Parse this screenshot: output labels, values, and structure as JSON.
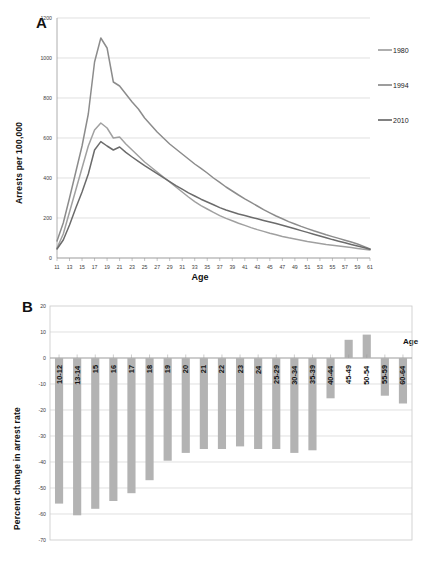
{
  "figure": {
    "panel_a_letter": "A",
    "panel_b_letter": "B"
  },
  "panel_a": {
    "ylabel": "Arrests per 100,000",
    "xlabel": "Age",
    "legend": [
      {
        "label": "1980",
        "color": "#a0a0a0"
      },
      {
        "label": "1994",
        "color": "#8c8c8c"
      },
      {
        "label": "2010",
        "color": "#6b6b6b"
      }
    ]
  },
  "panel_b": {
    "ylabel": "Percent change in arrest rate",
    "xlabel": "Age",
    "bar_color": "#b3b3b3"
  },
  "chart_data": [
    {
      "type": "line",
      "title": "A",
      "xlabel": "Age",
      "ylabel": "Arrests per 100,000",
      "xlim": [
        11,
        61
      ],
      "ylim": [
        0,
        1200
      ],
      "yticks": [
        0,
        200,
        400,
        600,
        800,
        1000,
        1200
      ],
      "xticks": [
        11,
        13,
        15,
        17,
        19,
        21,
        23,
        25,
        27,
        29,
        31,
        33,
        35,
        37,
        39,
        41,
        43,
        45,
        47,
        49,
        51,
        53,
        55,
        57,
        59,
        61
      ],
      "grid": true,
      "legend_position": "right",
      "x": [
        11,
        12,
        13,
        14,
        15,
        16,
        17,
        18,
        19,
        20,
        21,
        22,
        23,
        24,
        25,
        26,
        27,
        28,
        29,
        30,
        31,
        32,
        33,
        34,
        35,
        36,
        37,
        38,
        39,
        40,
        41,
        42,
        43,
        44,
        45,
        46,
        47,
        48,
        49,
        50,
        51,
        52,
        53,
        54,
        55,
        56,
        57,
        58,
        59,
        60,
        61
      ],
      "series": [
        {
          "name": "1980",
          "color": "#a0a0a0",
          "values": [
            50,
            120,
            230,
            340,
            450,
            560,
            640,
            675,
            650,
            600,
            605,
            570,
            540,
            510,
            480,
            455,
            430,
            405,
            380,
            355,
            330,
            305,
            282,
            262,
            245,
            228,
            212,
            198,
            186,
            174,
            163,
            152,
            142,
            133,
            124,
            116,
            108,
            101,
            95,
            89,
            83,
            78,
            73,
            68,
            64,
            60,
            56,
            52,
            48,
            44,
            40
          ]
        },
        {
          "name": "1994",
          "color": "#8c8c8c",
          "values": [
            85,
            175,
            300,
            430,
            560,
            720,
            980,
            1100,
            1050,
            880,
            860,
            820,
            780,
            745,
            700,
            665,
            630,
            600,
            570,
            545,
            520,
            495,
            470,
            448,
            425,
            400,
            378,
            355,
            335,
            315,
            296,
            278,
            260,
            242,
            226,
            210,
            196,
            182,
            170,
            158,
            147,
            136,
            126,
            116,
            107,
            98,
            89,
            80,
            70,
            58,
            45
          ]
        },
        {
          "name": "2010",
          "color": "#6b6b6b",
          "values": [
            45,
            90,
            165,
            250,
            330,
            420,
            540,
            582,
            560,
            540,
            555,
            528,
            505,
            483,
            462,
            442,
            422,
            402,
            382,
            362,
            344,
            326,
            310,
            294,
            280,
            266,
            252,
            240,
            230,
            220,
            212,
            204,
            196,
            188,
            180,
            172,
            164,
            155,
            146,
            137,
            128,
            119,
            110,
            101,
            92,
            84,
            76,
            68,
            60,
            52,
            44
          ]
        }
      ]
    },
    {
      "type": "bar",
      "title": "B",
      "xlabel": "Age",
      "ylabel": "Percent change in arrest rate",
      "ylim": [
        -70,
        20
      ],
      "yticks": [
        20,
        10,
        0,
        -10,
        -20,
        -30,
        -40,
        -50,
        -60,
        -70
      ],
      "grid": true,
      "categories": [
        "10-12",
        "13-14",
        "15",
        "16",
        "17",
        "18",
        "19",
        "20",
        "21",
        "22",
        "23",
        "24",
        "25-29",
        "30-34",
        "35-39",
        "40-44",
        "45-49",
        "50-54",
        "55-59",
        "60-64"
      ],
      "values": [
        -56,
        -60.5,
        -58,
        -55,
        -52,
        -47,
        -39.5,
        -36.5,
        -35,
        -35,
        -34,
        -35,
        -35,
        -36.5,
        -35.5,
        -15.5,
        7,
        9,
        -14.5,
        -17.5
      ]
    }
  ]
}
